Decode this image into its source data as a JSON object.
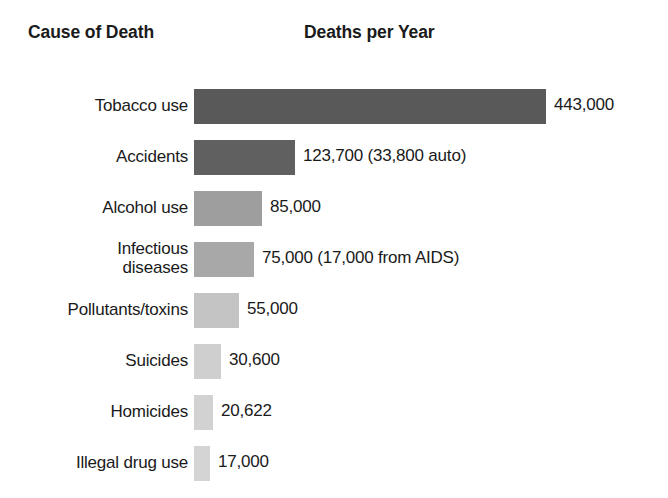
{
  "header": {
    "cause_label": "Cause of Death",
    "deaths_label": "Deaths per Year"
  },
  "chart_data": {
    "type": "bar",
    "orientation": "horizontal",
    "title": "",
    "xlabel": "Deaths per Year",
    "ylabel": "Cause of Death",
    "grid": false,
    "legend": null,
    "axis_labels_shown": false,
    "xlim": [
      0,
      443000
    ],
    "categories": [
      "Tobacco use",
      "Accidents",
      "Alcohol use",
      "Infectious diseases",
      "Pollutants/toxins",
      "Suicides",
      "Homicides",
      "Illegal drug use"
    ],
    "values": [
      443000,
      123700,
      85000,
      75000,
      55000,
      30600,
      20622,
      17000
    ],
    "value_labels": [
      "443,000",
      "123,700 (33,800 auto)",
      "85,000",
      "75,000 (17,000 from AIDS)",
      "55,000",
      "30,600",
      "20,622",
      "17,000"
    ],
    "bar_colors": [
      "#595959",
      "#606060",
      "#9e9e9e",
      "#a8a8a8",
      "#c4c4c4",
      "#cfcfcf",
      "#d2d2d2",
      "#d4d4d4"
    ]
  },
  "rows": [
    {
      "label_line1": "Tobacco use",
      "label_line2": "",
      "value": "443,000",
      "bar_width_px": 352,
      "color": "#595959"
    },
    {
      "label_line1": "Accidents",
      "label_line2": "",
      "value": "123,700 (33,800 auto)",
      "bar_width_px": 101,
      "color": "#606060"
    },
    {
      "label_line1": "Alcohol use",
      "label_line2": "",
      "value": "85,000",
      "bar_width_px": 68,
      "color": "#9e9e9e"
    },
    {
      "label_line1": "Infectious",
      "label_line2": "diseases",
      "value": "75,000 (17,000 from AIDS)",
      "bar_width_px": 60,
      "color": "#a8a8a8"
    },
    {
      "label_line1": "Pollutants/toxins",
      "label_line2": "",
      "value": "55,000",
      "bar_width_px": 45,
      "color": "#c4c4c4"
    },
    {
      "label_line1": "Suicides",
      "label_line2": "",
      "value": "30,600",
      "bar_width_px": 27,
      "color": "#cfcfcf"
    },
    {
      "label_line1": "Homicides",
      "label_line2": "",
      "value": "20,622",
      "bar_width_px": 19,
      "color": "#d2d2d2"
    },
    {
      "label_line1": "Illegal drug use",
      "label_line2": "",
      "value": "17,000",
      "bar_width_px": 16,
      "color": "#d4d4d4"
    }
  ]
}
